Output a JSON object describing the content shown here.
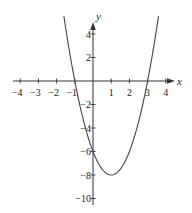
{
  "chart_data": {
    "type": "line",
    "title": "",
    "xlabel": "x",
    "ylabel": "y",
    "function": "y = 2x^2 - 4x - 6",
    "xlim": [
      -4.2,
      4.3
    ],
    "ylim": [
      -10.5,
      5
    ],
    "grid": false,
    "x_ticks": [
      -4,
      -3,
      -2,
      -1,
      1,
      2,
      3,
      4
    ],
    "x_tick_labels": [
      "−4",
      "−3",
      "−2",
      "−1",
      "1",
      "2",
      "3",
      "4"
    ],
    "y_ticks": [
      4,
      2,
      -2,
      -4,
      -6,
      -8,
      -10
    ],
    "y_tick_labels": [
      "4",
      "2",
      "−2",
      "−4",
      "−6",
      "−8",
      "−10"
    ],
    "key_points": [
      {
        "label": "x-intercept",
        "x": -1,
        "y": 0
      },
      {
        "label": "x-intercept",
        "x": 3,
        "y": 0
      },
      {
        "label": "y-intercept",
        "x": 0,
        "y": -6
      },
      {
        "label": "vertex",
        "x": 1,
        "y": -8
      }
    ],
    "series": [
      {
        "name": "parabola",
        "x": [
          -1.6,
          -1.5,
          -1,
          -0.5,
          0,
          0.5,
          1,
          1.5,
          2,
          2.5,
          3,
          3.5,
          3.6
        ],
        "y": [
          5.52,
          4.5,
          0,
          -3.5,
          -6,
          -7.5,
          -8,
          -7.5,
          -6,
          -3.5,
          0,
          4.5,
          5.52
        ]
      }
    ],
    "colors": {
      "axis": "#333333",
      "curve": "#444444"
    }
  }
}
